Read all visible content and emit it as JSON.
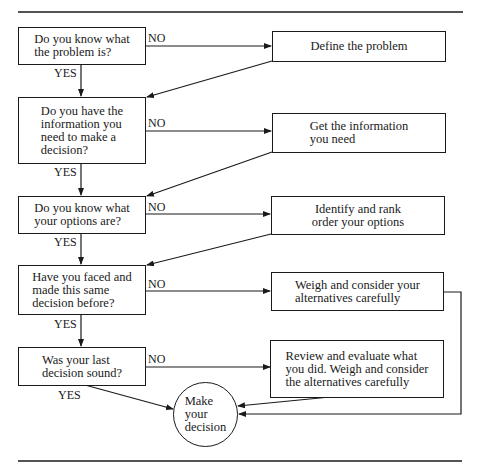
{
  "diagram": {
    "type": "flowchart",
    "questions": [
      {
        "id": "q1",
        "text": "Do you know what\nthe problem is?",
        "no_label": "NO",
        "yes_label": "YES"
      },
      {
        "id": "q2",
        "text": "Do you have the\ninformation you\nneed to make a\ndecision?",
        "no_label": "NO",
        "yes_label": "YES"
      },
      {
        "id": "q3",
        "text": "Do you know what\nyour options are?",
        "no_label": "NO",
        "yes_label": "YES"
      },
      {
        "id": "q4",
        "text": "Have you faced and\nmade this same\ndecision before?",
        "no_label": "NO",
        "yes_label": "YES"
      },
      {
        "id": "q5",
        "text": "Was your last\ndecision sound?",
        "no_label": "NO",
        "yes_label": "YES"
      }
    ],
    "actions": [
      {
        "id": "a1",
        "text": "Define the problem"
      },
      {
        "id": "a2",
        "text": "Get the information\nyou need"
      },
      {
        "id": "a3",
        "text": "Identify and rank\norder your options"
      },
      {
        "id": "a4",
        "text": "Weigh and consider your\nalternatives carefully"
      },
      {
        "id": "a5",
        "text": "Review and evaluate what\nyou did. Weigh and consider\nthe alternatives carefully"
      }
    ],
    "terminal": {
      "id": "end",
      "text": "Make\nyour\ndecision"
    },
    "edges": [
      {
        "from": "q1",
        "to": "a1",
        "label": "NO"
      },
      {
        "from": "q1",
        "to": "q2",
        "label": "YES"
      },
      {
        "from": "a1",
        "to": "q2"
      },
      {
        "from": "q2",
        "to": "a2",
        "label": "NO"
      },
      {
        "from": "q2",
        "to": "q3",
        "label": "YES"
      },
      {
        "from": "a2",
        "to": "q3"
      },
      {
        "from": "q3",
        "to": "a3",
        "label": "NO"
      },
      {
        "from": "q3",
        "to": "q4",
        "label": "YES"
      },
      {
        "from": "a3",
        "to": "q4"
      },
      {
        "from": "q4",
        "to": "a4",
        "label": "NO"
      },
      {
        "from": "q4",
        "to": "q5",
        "label": "YES"
      },
      {
        "from": "a4",
        "to": "end"
      },
      {
        "from": "q5",
        "to": "a5",
        "label": "NO"
      },
      {
        "from": "q5",
        "to": "end",
        "label": "YES"
      },
      {
        "from": "a5",
        "to": "end"
      }
    ],
    "colors": {
      "stroke": "#1a1a1a",
      "background": "#ffffff"
    }
  }
}
